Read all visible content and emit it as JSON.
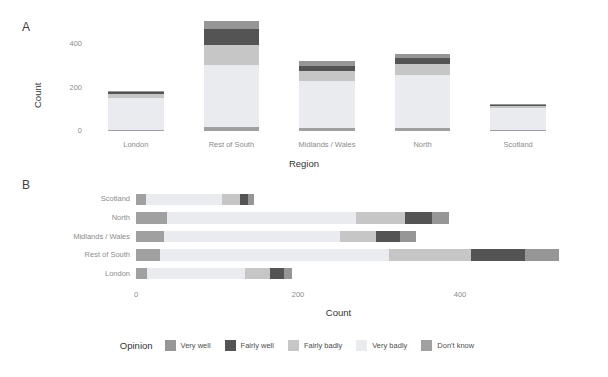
{
  "panels": {
    "a": {
      "tag": "A",
      "ylabel": "Count",
      "xlabel": "Region",
      "yticks": [
        "0",
        "200",
        "400"
      ],
      "ytick_values": [
        0,
        200,
        400
      ]
    },
    "b": {
      "tag": "B",
      "xlabel": "Count",
      "xticks": [
        "0",
        "200",
        "400"
      ],
      "xtick_values": [
        0,
        200,
        400
      ]
    }
  },
  "legend": {
    "title": "Opinion",
    "items": [
      {
        "label": "Very well",
        "color": "#969696"
      },
      {
        "label": "Fairly well",
        "color": "#545454"
      },
      {
        "label": "Fairly badly",
        "color": "#c6c6c6"
      },
      {
        "label": "Very badly",
        "color": "#e9ebee"
      },
      {
        "label": "Don't know",
        "color": "#a0a0a0"
      }
    ]
  },
  "chart_data": [
    {
      "type": "bar",
      "panel": "A",
      "orientation": "vertical",
      "stacked": true,
      "title": "",
      "xlabel": "Region",
      "ylabel": "Count",
      "ylim": [
        0,
        520
      ],
      "yticks": [
        0,
        200,
        400
      ],
      "grid": false,
      "legend_position": "bottom",
      "categories": [
        "London",
        "Rest of South",
        "Midlands / Wales",
        "North",
        "Scotland"
      ],
      "stack_order_bottom_to_top": [
        "Don't know",
        "Very badly",
        "Fairly badly",
        "Fairly well",
        "Very well"
      ],
      "series": [
        {
          "name": "Don't know",
          "color": "#a0a0a0",
          "values": [
            4,
            18,
            14,
            16,
            3
          ]
        },
        {
          "name": "Very badly",
          "color": "#e9ebee",
          "values": [
            148,
            288,
            218,
            240,
            105
          ]
        },
        {
          "name": "Fairly badly",
          "color": "#c6c6c6",
          "values": [
            18,
            92,
            42,
            52,
            8
          ]
        },
        {
          "name": "Fairly well",
          "color": "#545454",
          "values": [
            9,
            70,
            26,
            30,
            5
          ]
        },
        {
          "name": "Very well",
          "color": "#969696",
          "values": [
            6,
            40,
            22,
            18,
            4
          ]
        }
      ],
      "totals": [
        185,
        508,
        322,
        356,
        125
      ]
    },
    {
      "type": "bar",
      "panel": "B",
      "orientation": "horizontal",
      "stacked": true,
      "title": "",
      "xlabel": "Count",
      "ylabel": "",
      "xlim": [
        0,
        500
      ],
      "xticks": [
        0,
        200,
        400
      ],
      "grid": false,
      "legend_position": "bottom",
      "categories": [
        "London",
        "Rest of South",
        "Midlands / Wales",
        "North",
        "Scotland"
      ],
      "category_order_top_to_bottom": [
        "Scotland",
        "North",
        "Midlands / Wales",
        "Rest of South",
        "London"
      ],
      "stack_order_left_to_right": [
        "Don't know",
        "Very badly",
        "Fairly badly",
        "Fairly well",
        "Very well"
      ],
      "series": [
        {
          "name": "Don't know",
          "color": "#a0a0a0",
          "values": [
            14,
            30,
            34,
            38,
            12
          ]
        },
        {
          "name": "Very badly",
          "color": "#e9ebee",
          "values": [
            120,
            282,
            218,
            234,
            94
          ]
        },
        {
          "name": "Fairly badly",
          "color": "#c6c6c6",
          "values": [
            32,
            102,
            44,
            60,
            22
          ]
        },
        {
          "name": "Fairly well",
          "color": "#545454",
          "values": [
            17,
            66,
            30,
            34,
            10
          ]
        },
        {
          "name": "Very well",
          "color": "#969696",
          "values": [
            10,
            42,
            20,
            20,
            8
          ]
        }
      ],
      "totals": [
        193,
        522,
        346,
        386,
        146
      ]
    }
  ]
}
